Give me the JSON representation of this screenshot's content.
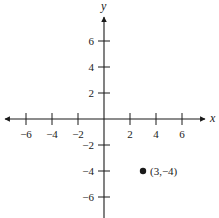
{
  "chart_data": {
    "type": "scatter",
    "title": "",
    "xlabel": "x",
    "ylabel": "y",
    "xlim": [
      -7.5,
      7.5
    ],
    "ylim": [
      -7.5,
      7.5
    ],
    "grid": false,
    "x_ticks": [
      -6,
      -4,
      -2,
      2,
      4,
      6
    ],
    "y_ticks": [
      6,
      4,
      2,
      -2,
      -4,
      -6
    ],
    "x_tick_labels": [
      "−6",
      "−4",
      "−2",
      "2",
      "4",
      "6"
    ],
    "y_tick_labels": [
      "6",
      "4",
      "2",
      "−2",
      "−4",
      "−6"
    ],
    "points": [
      {
        "x": 3,
        "y": -4,
        "label": "(3,−4)"
      }
    ],
    "legend": null
  }
}
